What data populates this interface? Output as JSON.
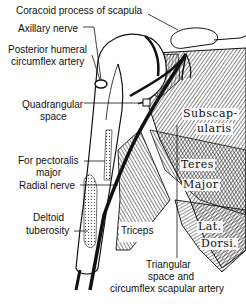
{
  "figure": {
    "type": "anatomical illustration"
  },
  "labels": {
    "coracoid": "Coracoid process of scapula",
    "axillary_nerve": "Axillary nerve",
    "posterior_humeral_1": "Posterior humeral",
    "posterior_humeral_2": "circumflex artery",
    "quadrangular_1": "Quadrangular",
    "quadrangular_2": "space",
    "pectoralis_1": "For pectoralis",
    "pectoralis_2": "major",
    "radial_nerve": "Radial nerve",
    "deltoid_1": "Deltoid",
    "deltoid_2": "tuberosity",
    "triceps": "Triceps",
    "triangular_1": "Triangular",
    "triangular_2": "space and",
    "triangular_3": "circumflex scapular artery"
  },
  "muscle_labels": {
    "subscap_1": "Subscap-",
    "subscap_2": "ularis",
    "teres_1": "Teres",
    "teres_2": "Major",
    "lat_1": "Lat.",
    "lat_2": "Dorsi."
  },
  "colors": {
    "ink": "#111111",
    "background": "#ffffff"
  }
}
